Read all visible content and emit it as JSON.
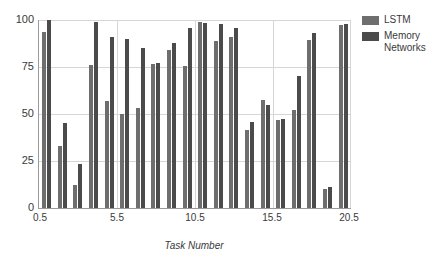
{
  "chart_data": {
    "type": "bar",
    "title": "",
    "xlabel": "Task Number",
    "ylabel": "",
    "ylim": [
      0,
      100
    ],
    "yticks": [
      0,
      25,
      50,
      75,
      100
    ],
    "xticks": [
      "0.5",
      "5.5",
      "10.5",
      "15.5",
      "20.5"
    ],
    "grid": true,
    "legend_position": "right",
    "categories": [
      1,
      2,
      3,
      4,
      5,
      6,
      7,
      8,
      9,
      10,
      11,
      12,
      13,
      14,
      15,
      16,
      17,
      18,
      19,
      20
    ],
    "series": [
      {
        "name": "LSTM",
        "color": "#6e6e6e",
        "values": [
          93.5,
          33,
          12.5,
          76,
          57,
          50,
          53,
          76.5,
          84,
          75.5,
          89,
          91,
          41.5,
          57.5,
          47,
          52,
          89.5,
          10,
          97.5,
          0
        ]
      },
      {
        "name": "Memory Networks",
        "color": "#4b4b4b",
        "values": [
          100,
          45,
          23.5,
          99,
          91,
          90,
          85,
          77,
          88,
          96,
          99,
          98.5,
          98,
          96,
          46,
          55,
          47.5,
          70,
          93,
          11
        ]
      }
    ],
    "series_pairs": [
      {
        "task": 1,
        "lstm": 93.5,
        "memnet": 100
      },
      {
        "task": 2,
        "lstm": 33,
        "memnet": 45
      },
      {
        "task": 3,
        "lstm": 12.5,
        "memnet": 23.5
      },
      {
        "task": 4,
        "lstm": 76,
        "memnet": 99
      },
      {
        "task": 5,
        "lstm": 57,
        "memnet": 91
      },
      {
        "task": 6,
        "lstm": 50,
        "memnet": 90
      },
      {
        "task": 7,
        "lstm": 53,
        "memnet": 85
      },
      {
        "task": 8,
        "lstm": 76.5,
        "memnet": 77
      },
      {
        "task": 9,
        "lstm": 84,
        "memnet": 88
      },
      {
        "task": 10,
        "lstm": 75.5,
        "memnet": 96
      },
      {
        "task": 11,
        "lstm": 99,
        "memnet": 98.5
      },
      {
        "task": 12,
        "lstm": 89,
        "memnet": 98
      },
      {
        "task": 13,
        "lstm": 91,
        "memnet": 96
      },
      {
        "task": 14,
        "lstm": 41.5,
        "memnet": 46
      },
      {
        "task": 15,
        "lstm": 57.5,
        "memnet": 55
      },
      {
        "task": 16,
        "lstm": 47,
        "memnet": 47.5
      },
      {
        "task": 17,
        "lstm": 52,
        "memnet": 70
      },
      {
        "task": 18,
        "lstm": 89.5,
        "memnet": 93
      },
      {
        "task": 19,
        "lstm": 10,
        "memnet": 11
      },
      {
        "task": 20,
        "lstm": 97.5,
        "memnet": 98
      }
    ]
  },
  "legend": {
    "items": [
      {
        "label": "LSTM",
        "color": "#6e6e6e"
      },
      {
        "label": "Memory\nNetworks",
        "color": "#4b4b4b"
      }
    ]
  },
  "axes": {
    "y_labels": [
      "100",
      "75",
      "50",
      "25",
      "0"
    ],
    "x_labels": [
      "0.5",
      "5.5",
      "10.5",
      "15.5",
      "20.5"
    ],
    "x_title": "Task Number"
  }
}
